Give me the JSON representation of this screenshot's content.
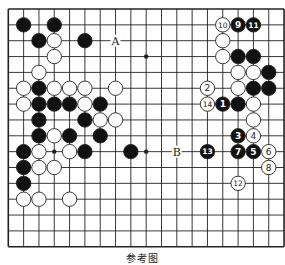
{
  "diagram": {
    "type": "go-board",
    "caption": "参考图",
    "grid": {
      "columns": 19,
      "rows_visible": 16,
      "left_x": 8.3,
      "top_y": 9,
      "col_spacing": 15.32,
      "row_spacing": 15.85
    },
    "star_points_visible": [
      [
        9,
        3
      ],
      [
        3,
        9
      ],
      [
        9,
        9
      ]
    ],
    "colors": {
      "line": "#222222",
      "black_stone": "#111111",
      "white_stone": "#ffffff",
      "stone_outline": "#222222",
      "background": "#ffffff"
    },
    "stones": [
      {
        "color": "black",
        "col": 1,
        "row": 1
      },
      {
        "color": "black",
        "col": 3,
        "row": 1
      },
      {
        "color": "black",
        "col": 2,
        "row": 2
      },
      {
        "color": "white",
        "col": 3,
        "row": 2
      },
      {
        "color": "black",
        "col": 5,
        "row": 2
      },
      {
        "color": "white",
        "col": 3,
        "row": 3
      },
      {
        "color": "white",
        "col": 2,
        "row": 4
      },
      {
        "color": "white",
        "col": 1,
        "row": 5
      },
      {
        "color": "black",
        "col": 2,
        "row": 5
      },
      {
        "color": "white",
        "col": 3,
        "row": 5
      },
      {
        "color": "white",
        "col": 4,
        "row": 5
      },
      {
        "color": "white",
        "col": 5,
        "row": 5
      },
      {
        "color": "white",
        "col": 7,
        "row": 5
      },
      {
        "color": "white",
        "col": 1,
        "row": 6
      },
      {
        "color": "black",
        "col": 2,
        "row": 6
      },
      {
        "color": "black",
        "col": 3,
        "row": 6
      },
      {
        "color": "black",
        "col": 4,
        "row": 6
      },
      {
        "color": "white",
        "col": 5,
        "row": 6
      },
      {
        "color": "black",
        "col": 6,
        "row": 6
      },
      {
        "color": "black",
        "col": 2,
        "row": 7
      },
      {
        "color": "black",
        "col": 5,
        "row": 7
      },
      {
        "color": "white",
        "col": 6,
        "row": 7
      },
      {
        "color": "white",
        "col": 7,
        "row": 7
      },
      {
        "color": "black",
        "col": 2,
        "row": 8
      },
      {
        "color": "white",
        "col": 3,
        "row": 8
      },
      {
        "color": "black",
        "col": 4,
        "row": 8
      },
      {
        "color": "black",
        "col": 6,
        "row": 8
      },
      {
        "color": "black",
        "col": 1,
        "row": 9
      },
      {
        "color": "white",
        "col": 2,
        "row": 9
      },
      {
        "color": "white",
        "col": 4,
        "row": 9
      },
      {
        "color": "black",
        "col": 5,
        "row": 9
      },
      {
        "color": "black",
        "col": 8,
        "row": 9
      },
      {
        "color": "black",
        "col": 1,
        "row": 10
      },
      {
        "color": "white",
        "col": 2,
        "row": 10
      },
      {
        "color": "white",
        "col": 3,
        "row": 10
      },
      {
        "color": "black",
        "col": 1,
        "row": 11
      },
      {
        "color": "white",
        "col": 1,
        "row": 12
      },
      {
        "color": "white",
        "col": 2,
        "row": 12
      },
      {
        "color": "white",
        "col": 4,
        "row": 12
      },
      {
        "color": "white",
        "col": 14,
        "row": 1,
        "label": "10"
      },
      {
        "color": "black",
        "col": 15,
        "row": 1,
        "label": "9"
      },
      {
        "color": "black",
        "col": 16,
        "row": 1,
        "label": "11"
      },
      {
        "color": "white",
        "col": 14,
        "row": 2
      },
      {
        "color": "white",
        "col": 14,
        "row": 3
      },
      {
        "color": "black",
        "col": 15,
        "row": 3
      },
      {
        "color": "black",
        "col": 16,
        "row": 3
      },
      {
        "color": "white",
        "col": 15,
        "row": 4
      },
      {
        "color": "white",
        "col": 16,
        "row": 4
      },
      {
        "color": "black",
        "col": 17,
        "row": 4
      },
      {
        "color": "white",
        "col": 13,
        "row": 5,
        "label": "2"
      },
      {
        "color": "white",
        "col": 15,
        "row": 5
      },
      {
        "color": "black",
        "col": 16,
        "row": 5
      },
      {
        "color": "black",
        "col": 17,
        "row": 5
      },
      {
        "color": "white",
        "col": 13,
        "row": 6,
        "label": "14"
      },
      {
        "color": "black",
        "col": 14,
        "row": 6,
        "label": "1"
      },
      {
        "color": "black",
        "col": 15,
        "row": 6
      },
      {
        "color": "white",
        "col": 16,
        "row": 6
      },
      {
        "color": "white",
        "col": 16,
        "row": 7
      },
      {
        "color": "black",
        "col": 15,
        "row": 8,
        "label": "3"
      },
      {
        "color": "white",
        "col": 16,
        "row": 8,
        "label": "4"
      },
      {
        "color": "black",
        "col": 13,
        "row": 9,
        "label": "13"
      },
      {
        "color": "black",
        "col": 15,
        "row": 9,
        "label": "7"
      },
      {
        "color": "black",
        "col": 16,
        "row": 9,
        "label": "5"
      },
      {
        "color": "white",
        "col": 17,
        "row": 9,
        "label": "6"
      },
      {
        "color": "white",
        "col": 17,
        "row": 10,
        "label": "8"
      },
      {
        "color": "white",
        "col": 15,
        "row": 11,
        "label": "12"
      }
    ],
    "markers": [
      {
        "label": "A",
        "col": 7,
        "row": 2
      },
      {
        "label": "B",
        "col": 11,
        "row": 9
      }
    ]
  }
}
